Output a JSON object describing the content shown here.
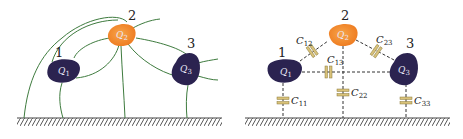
{
  "colors": {
    "conductor_dark": "#2b2350",
    "conductor_orange": "#f08a2a",
    "field_line": "#3e7b3e",
    "capacitor": "#d9c27a",
    "ground": "#444444"
  },
  "left_panel": {
    "description": "Field lines between three conductors and ground",
    "conductors": [
      {
        "number": "1",
        "label": "Q",
        "sub": "1"
      },
      {
        "number": "2",
        "label": "Q",
        "sub": "2"
      },
      {
        "number": "3",
        "label": "Q",
        "sub": "3"
      }
    ]
  },
  "right_panel": {
    "description": "Equivalent partial capacitance network",
    "conductors": [
      {
        "number": "1",
        "label": "Q",
        "sub": "1"
      },
      {
        "number": "2",
        "label": "Q",
        "sub": "2"
      },
      {
        "number": "3",
        "label": "Q",
        "sub": "3"
      }
    ],
    "capacitors": [
      {
        "label": "C",
        "sub": "12"
      },
      {
        "label": "C",
        "sub": "13"
      },
      {
        "label": "C",
        "sub": "23"
      },
      {
        "label": "C",
        "sub": "11"
      },
      {
        "label": "C",
        "sub": "22"
      },
      {
        "label": "C",
        "sub": "33"
      }
    ]
  }
}
